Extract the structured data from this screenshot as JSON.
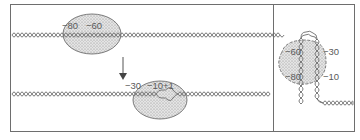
{
  "diagram": {
    "panels": [
      {
        "name": "linear-promoter-binding",
        "steps": [
          {
            "name": "closed-complex",
            "labels": [
              "−80",
              "−60"
            ]
          },
          {
            "name": "open-complex",
            "labels": [
              "−30",
              "−10",
              "+1"
            ]
          }
        ],
        "arrow": "down"
      },
      {
        "name": "wrapped-dna-complex",
        "labels_left": [
          "−60",
          "−80"
        ],
        "labels_right": [
          "−30",
          "−10"
        ]
      }
    ],
    "colors": {
      "line": "#6e6e6e",
      "blob_fill": "#d6d6d6",
      "text": "#5a5a5a"
    }
  },
  "labels": {
    "m80": "−80",
    "m60": "−60",
    "m30": "−30",
    "m10": "−10",
    "p1": "+1",
    "r_m60": "−60",
    "r_m80": "−80",
    "r_m30": "−30",
    "r_m10": "−10"
  }
}
